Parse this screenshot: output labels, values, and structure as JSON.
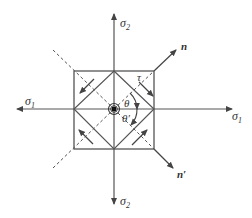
{
  "diagram": {
    "type": "stress-state-element",
    "labels": {
      "sigma2_top": "σ",
      "sigma2_top_sub": "2",
      "sigma2_bottom": "σ",
      "sigma2_bottom_sub": "2",
      "sigma1_left": "σ",
      "sigma1_left_sub": "1",
      "sigma1_right": "σ",
      "sigma1_right_sub": "1",
      "n": "n",
      "n_prime": "n′",
      "tau": "τ",
      "theta": "θ",
      "theta_prime": "θ′"
    },
    "colors": {
      "line": "#444444",
      "background": "#ffffff"
    }
  }
}
